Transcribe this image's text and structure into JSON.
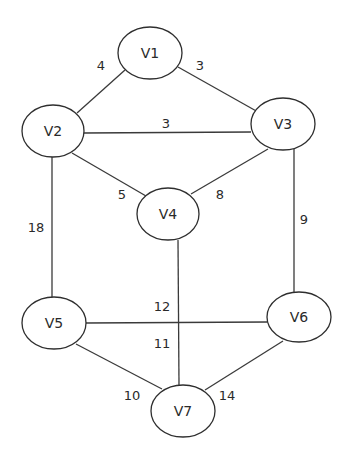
{
  "graph": {
    "type": "undirected-weighted",
    "nodes": [
      {
        "id": "V1",
        "label": "V1",
        "cx": 150,
        "cy": 53,
        "rx": 32,
        "ry": 26
      },
      {
        "id": "V2",
        "label": "V2",
        "cx": 53,
        "cy": 131,
        "rx": 31,
        "ry": 26
      },
      {
        "id": "V3",
        "label": "V3",
        "cx": 283,
        "cy": 124,
        "rx": 32,
        "ry": 26
      },
      {
        "id": "V4",
        "label": "V4",
        "cx": 168,
        "cy": 214,
        "rx": 31,
        "ry": 26
      },
      {
        "id": "V5",
        "label": "V5",
        "cx": 54,
        "cy": 323,
        "rx": 32,
        "ry": 26
      },
      {
        "id": "V6",
        "label": "V6",
        "cx": 299,
        "cy": 317,
        "rx": 32,
        "ry": 25
      },
      {
        "id": "V7",
        "label": "V7",
        "cx": 183,
        "cy": 411,
        "rx": 32,
        "ry": 26
      }
    ],
    "edges": [
      {
        "from": "V1",
        "to": "V2",
        "weight": "4",
        "x1": 125,
        "y1": 70,
        "x2": 77,
        "y2": 113,
        "lx": 101,
        "ly": 65
      },
      {
        "from": "V1",
        "to": "V3",
        "weight": "3",
        "x1": 178,
        "y1": 67,
        "x2": 258,
        "y2": 112,
        "lx": 200,
        "ly": 65
      },
      {
        "from": "V2",
        "to": "V3",
        "weight": "3",
        "x1": 84,
        "y1": 133,
        "x2": 251,
        "y2": 132,
        "lx": 166,
        "ly": 123
      },
      {
        "from": "V2",
        "to": "V4",
        "weight": "5",
        "x1": 72,
        "y1": 153,
        "x2": 146,
        "y2": 196,
        "lx": 122,
        "ly": 194
      },
      {
        "from": "V3",
        "to": "V4",
        "weight": "8",
        "x1": 268,
        "y1": 149,
        "x2": 191,
        "y2": 194,
        "lx": 220,
        "ly": 194
      },
      {
        "from": "V2",
        "to": "V5",
        "weight": "18",
        "x1": 52,
        "y1": 157,
        "x2": 52,
        "y2": 298,
        "lx": 36,
        "ly": 227
      },
      {
        "from": "V3",
        "to": "V6",
        "weight": "9",
        "x1": 294,
        "y1": 149,
        "x2": 294,
        "y2": 292,
        "lx": 304,
        "ly": 219
      },
      {
        "from": "V4",
        "to": "V7",
        "weight": "11",
        "x1": 178,
        "y1": 240,
        "x2": 179,
        "y2": 385,
        "lx": 162,
        "ly": 343
      },
      {
        "from": "V5",
        "to": "V6",
        "weight": "12",
        "x1": 86,
        "y1": 323,
        "x2": 267,
        "y2": 322,
        "lx": 162,
        "ly": 306
      },
      {
        "from": "V5",
        "to": "V7",
        "weight": "10",
        "x1": 76,
        "y1": 344,
        "x2": 162,
        "y2": 389,
        "lx": 132,
        "ly": 395
      },
      {
        "from": "V6",
        "to": "V7",
        "weight": "14",
        "x1": 283,
        "y1": 341,
        "x2": 205,
        "y2": 390,
        "lx": 227,
        "ly": 395
      }
    ]
  }
}
